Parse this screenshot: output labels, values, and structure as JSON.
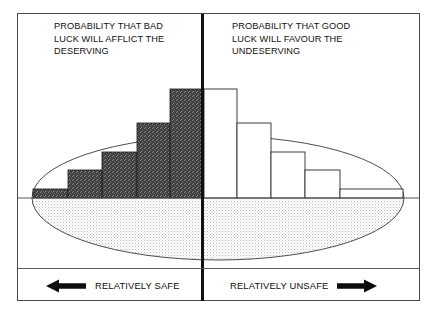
{
  "figure": {
    "type": "conceptual-diagram",
    "left_panel": {
      "caption": "PROBABILITY THAT BAD\nLUCK WILL AFFLICT THE\nDESERVING",
      "legend_label": "RELATIVELY SAFE",
      "arrow_icon": "arrow-left-icon",
      "arrow_direction": "left"
    },
    "right_panel": {
      "caption": "PROBABILITY THAT GOOD\nLUCK WILL FAVOUR THE\nUNDESERVING",
      "legend_label": "RELATIVELY UNSAFE",
      "arrow_icon": "arrow-right-icon",
      "arrow_direction": "right"
    }
  },
  "chart_data": {
    "type": "bar",
    "title": "",
    "subtitle": "",
    "xlabel": "",
    "ylabel": "",
    "grid": false,
    "legend_position": "bottom",
    "axis": {
      "baseline_y_px": 198,
      "x_range_px": [
        33,
        403
      ],
      "divider_x_px": 202,
      "ylim": [
        0,
        110
      ]
    },
    "colors": {
      "left_bar_fill": "#4d4d4d",
      "left_bar_stroke": "#1a1a1a",
      "right_bar_fill": "#ffffff",
      "right_bar_stroke": "#2b2b2b",
      "ellipse_fill": "#e9e9e9",
      "ellipse_stroke": "#3a3a3a",
      "frame_stroke": "#4a4a4a",
      "divider": "#111111",
      "text": "#111111"
    },
    "ellipse": {
      "cx_px": 218,
      "cy_px": 198,
      "rx_px": 186,
      "ry_px": 62,
      "note": "shaded ellipse straddling the baseline; lower half stippled grey"
    },
    "series": [
      {
        "name": "PROBABILITY THAT BAD LUCK WILL AFFLICT THE DESERVING",
        "side": "left",
        "fill": "dark-dither",
        "categories": [
          "1",
          "2",
          "3",
          "4",
          "5"
        ],
        "values": [
          9,
          34,
          55,
          83,
          109
        ],
        "bars_px": [
          {
            "x": 33,
            "w": 35,
            "top_y": 189,
            "height": 9
          },
          {
            "x": 68,
            "w": 34,
            "top_y": 170,
            "height": 28
          },
          {
            "x": 102,
            "w": 35,
            "top_y": 152,
            "height": 46
          },
          {
            "x": 137,
            "w": 33,
            "top_y": 123,
            "height": 75
          },
          {
            "x": 170,
            "w": 32,
            "top_y": 89,
            "height": 109
          }
        ]
      },
      {
        "name": "PROBABILITY THAT GOOD LUCK WILL FAVOUR THE UNDESERVING",
        "side": "right",
        "fill": "white",
        "categories": [
          "1",
          "2",
          "3",
          "4",
          "5"
        ],
        "values": [
          109,
          83,
          55,
          34,
          9
        ],
        "bars_px": [
          {
            "x": 204,
            "w": 33,
            "top_y": 89,
            "height": 109
          },
          {
            "x": 237,
            "w": 34,
            "top_y": 123,
            "height": 75
          },
          {
            "x": 271,
            "w": 34,
            "top_y": 152,
            "height": 46
          },
          {
            "x": 305,
            "w": 35,
            "top_y": 170,
            "height": 28
          },
          {
            "x": 340,
            "w": 63,
            "top_y": 189,
            "height": 9
          }
        ]
      }
    ]
  }
}
